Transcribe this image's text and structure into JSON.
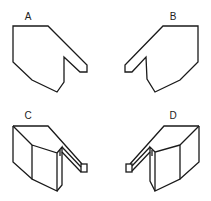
{
  "diagram": {
    "type": "spatial-reasoning options",
    "stroke_color": "#1a1a1a",
    "background": "#ffffff",
    "options": [
      {
        "label": "A",
        "kind": "2d-outline",
        "orientation": "tab-right"
      },
      {
        "label": "B",
        "kind": "2d-outline",
        "orientation": "tab-left"
      },
      {
        "label": "C",
        "kind": "3d-solid",
        "orientation": "tab-right"
      },
      {
        "label": "D",
        "kind": "3d-solid",
        "orientation": "tab-left"
      }
    ]
  }
}
